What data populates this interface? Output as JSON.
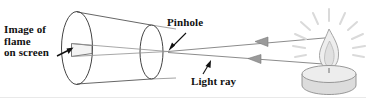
{
  "figure": {
    "background_color": "#ffffff",
    "width": 366,
    "height": 106,
    "labels": {
      "image_of_flame": "Image of\nflame\non screen",
      "image_of_flame_lines": [
        "Image of",
        "flame",
        "on screen"
      ],
      "pinhole": "Pinhole",
      "light_ray": "Light ray"
    },
    "colors": {
      "label_text": "#111111",
      "outline": "#3a3a3a",
      "light_outline": "#8a8a8a",
      "ray": "#7d7d7d",
      "arrow": "#111111",
      "candle_body": "#d9d9d9",
      "flame": "#e2e2e2",
      "sparkle": "#dcdcdc",
      "divider": "#e8e8e8"
    },
    "parts": {
      "box_label": "pinhole-camera-box",
      "screen_end_label": "screen-end-ellipse",
      "pinhole_end_label": "pinhole-end-ellipse",
      "inverted_image_label": "inverted-flame-image",
      "ray_upper_label": "light-ray-upper",
      "ray_lower_label": "light-ray-lower",
      "candle_label": "candle",
      "flame_label": "candle-flame",
      "sparkle_label": "light-sparkle-rays"
    }
  }
}
